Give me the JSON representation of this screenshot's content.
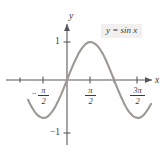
{
  "figure": {
    "title": "",
    "annotation": "y = sin x",
    "background_color": "#ffffff",
    "curve_color": "#9d9893",
    "axis_color": "#58565a",
    "annotation_bg": "#f1f0ef"
  },
  "axes": {
    "x_axis_label": "x",
    "y_axis_label": "y",
    "x_ticks": [
      {
        "label_numerator": "π",
        "label_denominator": "2",
        "label_sign": "−",
        "label_text": "−π/2",
        "value": -1.5707963
      },
      {
        "label_numerator": "π",
        "label_denominator": "2",
        "label_sign": "",
        "label_text": "π/2",
        "value": 1.5707963
      },
      {
        "label_numerator": "3π",
        "label_denominator": "2",
        "label_sign": "",
        "label_text": "3π/2",
        "value": 4.712389
      }
    ],
    "y_ticks": [
      {
        "label": "1",
        "value": 1
      },
      {
        "label": "−1",
        "value": -1
      }
    ]
  },
  "chart_data": {
    "type": "line",
    "title": "",
    "subtitle": "",
    "xlabel": "x",
    "ylabel": "y",
    "grid": false,
    "legend_position": "top-right",
    "annotations": [
      {
        "text": "y = sin x",
        "x": 5.6,
        "y": 1.55
      }
    ],
    "xlim": [
      -2.6,
      6.4
    ],
    "ylim": [
      -1.45,
      1.75
    ],
    "xtick_values": [
      -1.5707963,
      1.5707963,
      4.712389
    ],
    "xtick_labels": [
      "−π/2",
      "π/2",
      "3π/2"
    ],
    "ytick_values": [
      1,
      -1
    ],
    "ytick_labels": [
      "1",
      "−1"
    ],
    "series": [
      {
        "name": "y = sin x",
        "equation": "y = sin(x)",
        "color": "#9d9893",
        "amplitude": 1,
        "period": 6.2831853,
        "x": [
          -2.6,
          -2.4,
          -2.2,
          -2.0,
          -1.8,
          -1.6,
          -1.4,
          -1.2,
          -1.0,
          -0.8,
          -0.6,
          -0.4,
          -0.2,
          0.0,
          0.2,
          0.4,
          0.6,
          0.8,
          1.0,
          1.2,
          1.4,
          1.6,
          1.8,
          2.0,
          2.2,
          2.4,
          2.6,
          2.8,
          3.0,
          3.2,
          3.4,
          3.6,
          3.8,
          4.0,
          4.2,
          4.4,
          4.6,
          4.8,
          5.0,
          5.2,
          5.4,
          5.6,
          5.8,
          6.0,
          6.2,
          6.4
        ],
        "y": [
          -0.52,
          -0.68,
          -0.81,
          -0.91,
          -0.97,
          -1.0,
          -0.99,
          -0.93,
          -0.84,
          -0.72,
          -0.56,
          -0.39,
          -0.2,
          0.0,
          0.2,
          0.39,
          0.56,
          0.72,
          0.84,
          0.93,
          0.99,
          1.0,
          0.97,
          0.91,
          0.81,
          0.68,
          0.52,
          0.33,
          0.14,
          -0.06,
          -0.26,
          -0.44,
          -0.61,
          -0.76,
          -0.87,
          -0.95,
          -0.99,
          -1.0,
          -0.96,
          -0.88,
          -0.77,
          -0.63,
          -0.46,
          -0.28,
          -0.08,
          0.12
        ]
      }
    ],
    "key_points": [
      {
        "x": -1.5707963,
        "y": -1,
        "kind": "minimum"
      },
      {
        "x": 0,
        "y": 0,
        "kind": "zero-crossing"
      },
      {
        "x": 1.5707963,
        "y": 1,
        "kind": "maximum"
      },
      {
        "x": 3.1415927,
        "y": 0,
        "kind": "zero-crossing"
      },
      {
        "x": 4.712389,
        "y": -1,
        "kind": "minimum"
      },
      {
        "x": 6.2831853,
        "y": 0,
        "kind": "zero-crossing"
      }
    ]
  }
}
